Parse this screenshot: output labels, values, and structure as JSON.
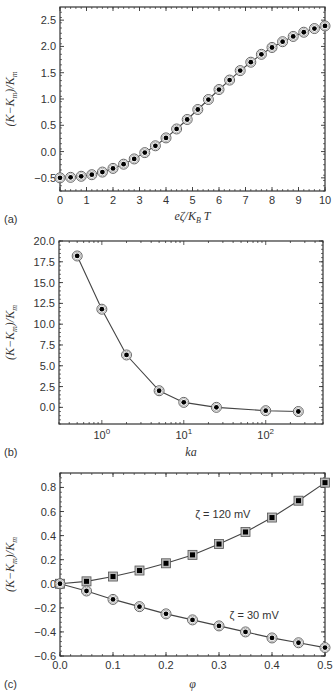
{
  "chart_data": [
    {
      "panel": "(a)",
      "type": "line",
      "title": "",
      "xlabel": "eζ/K_B T",
      "ylabel": "(K−K_m)/K_m",
      "xlim": [
        0,
        10
      ],
      "ylim": [
        -0.75,
        2.75
      ],
      "xscale": "linear",
      "xticks": [
        0,
        1,
        2,
        3,
        4,
        5,
        6,
        7,
        8,
        9,
        10
      ],
      "yticks": [
        -0.5,
        0.0,
        0.5,
        1.0,
        1.5,
        2.0,
        2.5
      ],
      "ytick_labels": [
        "-0.5",
        "0.0",
        "0.5",
        "1.0",
        "1.5",
        "2.0",
        "2.5"
      ],
      "grid": false,
      "legend": null,
      "series": [
        {
          "name": "data",
          "marker": "circle-dot",
          "x": [
            0,
            0.4,
            0.8,
            1.2,
            1.6,
            2.0,
            2.4,
            2.8,
            3.2,
            3.6,
            4.0,
            4.4,
            4.8,
            5.2,
            5.6,
            6.0,
            6.4,
            6.8,
            7.2,
            7.6,
            8.0,
            8.4,
            8.8,
            9.2,
            9.6,
            10.0
          ],
          "y": [
            -0.5,
            -0.49,
            -0.47,
            -0.44,
            -0.39,
            -0.32,
            -0.24,
            -0.14,
            -0.02,
            0.11,
            0.26,
            0.43,
            0.61,
            0.8,
            0.99,
            1.18,
            1.36,
            1.54,
            1.7,
            1.85,
            1.98,
            2.09,
            2.19,
            2.27,
            2.34,
            2.39
          ]
        }
      ]
    },
    {
      "panel": "(b)",
      "type": "line",
      "title": "",
      "xlabel": "ka",
      "ylabel": "(K−K_m)/K_m",
      "xlim": [
        0.3,
        500
      ],
      "ylim": [
        -2.0,
        20.0
      ],
      "xscale": "log",
      "xticks": [
        1,
        10,
        100
      ],
      "xtick_labels": [
        "10^0",
        "10^1",
        "10^2"
      ],
      "yticks": [
        0.0,
        2.5,
        5.0,
        7.5,
        10.0,
        12.5,
        15.0,
        17.5,
        20.0
      ],
      "ytick_labels": [
        "0.0",
        "2.5",
        "5.0",
        "7.5",
        "10.0",
        "12.5",
        "15.0",
        "17.5",
        "20.0"
      ],
      "grid": false,
      "legend": null,
      "series": [
        {
          "name": "data",
          "marker": "circle-dot",
          "x": [
            0.5,
            1.0,
            2.0,
            5.0,
            10.0,
            25.0,
            100.0,
            250.0
          ],
          "y": [
            18.2,
            11.8,
            6.3,
            2.0,
            0.6,
            0.0,
            -0.4,
            -0.5
          ]
        }
      ]
    },
    {
      "panel": "(c)",
      "type": "line",
      "title": "",
      "xlabel": "φ",
      "ylabel": "(K−K_m)/K_m",
      "xlim": [
        0.0,
        0.5
      ],
      "ylim": [
        -0.6,
        0.92
      ],
      "xscale": "linear",
      "xticks": [
        0.0,
        0.1,
        0.2,
        0.3,
        0.4,
        0.5
      ],
      "xtick_labels": [
        "0.0",
        "0.1",
        "0.2",
        "0.3",
        "0.4",
        "0.5"
      ],
      "yticks": [
        -0.6,
        -0.4,
        -0.2,
        0.0,
        0.2,
        0.4,
        0.6,
        0.8
      ],
      "ytick_labels": [
        "-0.6",
        "-0.4",
        "-0.2",
        "0.0",
        "0.2",
        "0.4",
        "0.6",
        "0.8"
      ],
      "grid": false,
      "legend": null,
      "annotations": [
        {
          "text": "ζ = 120 mV",
          "x": 0.255,
          "y": 0.55
        },
        {
          "text": "ζ = 30 mV",
          "x": 0.32,
          "y": -0.29
        }
      ],
      "series": [
        {
          "name": "ζ = 120 mV",
          "marker": "square-dot",
          "x": [
            0.0,
            0.05,
            0.1,
            0.15,
            0.2,
            0.25,
            0.3,
            0.35,
            0.4,
            0.45,
            0.5
          ],
          "y": [
            0.0,
            0.02,
            0.06,
            0.11,
            0.17,
            0.24,
            0.33,
            0.43,
            0.55,
            0.69,
            0.84
          ]
        },
        {
          "name": "ζ = 30 mV",
          "marker": "circle-dot",
          "x": [
            0.0,
            0.05,
            0.1,
            0.15,
            0.2,
            0.25,
            0.3,
            0.35,
            0.4,
            0.45,
            0.5
          ],
          "y": [
            0.0,
            -0.06,
            -0.13,
            -0.19,
            -0.25,
            -0.3,
            -0.35,
            -0.4,
            -0.45,
            -0.49,
            -0.53
          ]
        }
      ]
    }
  ],
  "figure": {
    "panels": [
      {
        "label": "(a)",
        "frame": {
          "left": 60,
          "top": 7,
          "right": 325,
          "bottom": 191
        }
      },
      {
        "label": "(b)",
        "frame": {
          "left": 59,
          "top": 241,
          "right": 323,
          "bottom": 424
        }
      },
      {
        "label": "(c)",
        "frame": {
          "left": 60,
          "top": 473,
          "right": 325,
          "bottom": 656
        }
      }
    ],
    "colors": {
      "axis": "#333333",
      "line": "#444444",
      "marker_fill": "#000000",
      "marker_ring": "#999999"
    }
  }
}
